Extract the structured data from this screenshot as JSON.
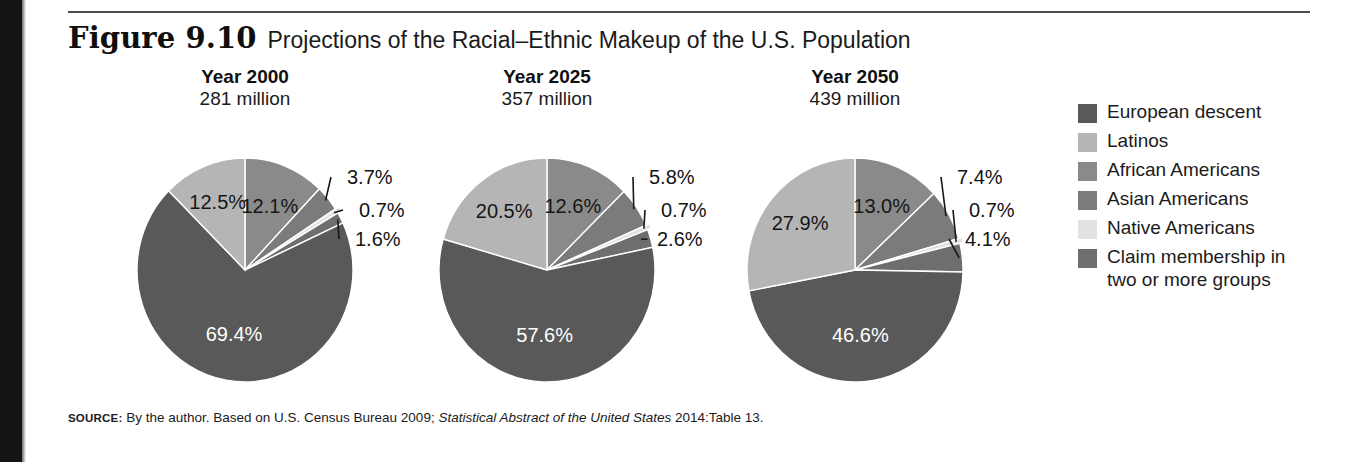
{
  "figure": {
    "number": "Figure 9.10",
    "title": "Projections of the Racial–Ethnic Makeup of the U.S. Population"
  },
  "source": {
    "keyword": "SOURCE:",
    "text_before_italic": " By the author. Based on U.S. Census Bureau 2009; ",
    "italic_text": "Statistical Abstract of the United States",
    "text_after_italic": " 2014:Table 13."
  },
  "legend": {
    "items": [
      {
        "label": "European descent",
        "color": "#595959",
        "swatch": "legend-swatch-european-descent"
      },
      {
        "label": "Latinos",
        "color": "#b5b5b5",
        "swatch": "legend-swatch-latinos"
      },
      {
        "label": "African Americans",
        "color": "#8a8a8a",
        "swatch": "legend-swatch-african-americans"
      },
      {
        "label": "Asian Americans",
        "color": "#7b7b7b",
        "swatch": "legend-swatch-asian-americans"
      },
      {
        "label": "Native Americans",
        "color": "#e2e2e2",
        "swatch": "legend-swatch-native-americans"
      },
      {
        "label": "Claim membership in\ntwo or more groups",
        "color": "#6e6e6e",
        "swatch": "legend-swatch-claim-membership"
      }
    ]
  },
  "chart_data": {
    "type": "pie",
    "title": "Projections of the Racial–Ethnic Makeup of the U.S. Population",
    "legend_position": "right",
    "grid": false,
    "categories": [
      "European descent",
      "Latinos",
      "African Americans",
      "Asian Americans",
      "Native Americans",
      "Claim membership in two or more groups"
    ],
    "colors": [
      "#595959",
      "#b5b5b5",
      "#8a8a8a",
      "#7b7b7b",
      "#e2e2e2",
      "#6e6e6e"
    ],
    "charts": [
      {
        "year_label": "Year 2000",
        "population_label": "281 million",
        "year": 2000,
        "population_millions": 281,
        "slices": [
          {
            "name": "European descent",
            "value": 69.4,
            "label": "69.4%",
            "color": "#595959"
          },
          {
            "name": "Latinos",
            "value": 12.5,
            "label": "12.5%",
            "color": "#b5b5b5"
          },
          {
            "name": "African Americans",
            "value": 12.1,
            "label": "12.1%",
            "color": "#8a8a8a"
          },
          {
            "name": "Asian Americans",
            "value": 3.7,
            "label": "3.7%",
            "color": "#7b7b7b"
          },
          {
            "name": "Native Americans",
            "value": 0.7,
            "label": "0.7%",
            "color": "#e2e2e2"
          },
          {
            "name": "Claim membership in two or more groups",
            "value": 1.6,
            "label": "1.6%",
            "color": "#6e6e6e"
          }
        ]
      },
      {
        "year_label": "Year 2025",
        "population_label": "357 million",
        "year": 2025,
        "population_millions": 357,
        "slices": [
          {
            "name": "European descent",
            "value": 57.6,
            "label": "57.6%",
            "color": "#595959"
          },
          {
            "name": "Latinos",
            "value": 20.5,
            "label": "20.5%",
            "color": "#b5b5b5"
          },
          {
            "name": "African Americans",
            "value": 12.6,
            "label": "12.6%",
            "color": "#8a8a8a"
          },
          {
            "name": "Asian Americans",
            "value": 5.8,
            "label": "5.8%",
            "color": "#7b7b7b"
          },
          {
            "name": "Native Americans",
            "value": 0.7,
            "label": "0.7%",
            "color": "#e2e2e2"
          },
          {
            "name": "Claim membership in two or more groups",
            "value": 2.6,
            "label": "2.6%",
            "color": "#6e6e6e"
          }
        ]
      },
      {
        "year_label": "Year 2050",
        "population_label": "439 million",
        "year": 2050,
        "population_millions": 439,
        "slices": [
          {
            "name": "European descent",
            "value": 46.6,
            "label": "46.6%",
            "color": "#595959"
          },
          {
            "name": "Latinos",
            "value": 27.9,
            "label": "27.9%",
            "color": "#b5b5b5"
          },
          {
            "name": "African Americans",
            "value": 13.0,
            "label": "13.0%",
            "color": "#8a8a8a"
          },
          {
            "name": "Asian Americans",
            "value": 7.4,
            "label": "7.4%",
            "color": "#7b7b7b"
          },
          {
            "name": "Native Americans",
            "value": 0.7,
            "label": "0.7%",
            "color": "#e2e2e2"
          },
          {
            "name": "Claim membership in two or more groups",
            "value": 4.1,
            "label": "4.1%",
            "color": "#6e6e6e"
          }
        ]
      }
    ]
  }
}
